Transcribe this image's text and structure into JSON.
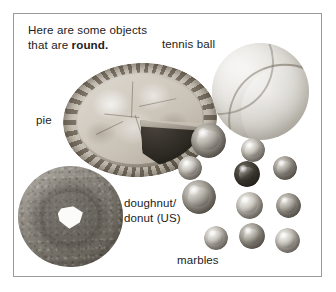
{
  "panel": {
    "border_color": "#9a9a9a",
    "background": "#ffffff"
  },
  "heading": {
    "line1": "Here are some objects",
    "line2_prefix": "that are ",
    "line2_bold": "round."
  },
  "labels": {
    "tennis_ball": "tennis ball",
    "pie": "pie",
    "doughnut_line1": "doughnut/",
    "doughnut_line2": "donut (US)",
    "marbles": "marbles"
  },
  "objects": [
    {
      "name": "pie",
      "shape": "ellipse",
      "note": "baked pie with crimped crust, one dark slice removed at lower right"
    },
    {
      "name": "tennis-ball",
      "shape": "circle",
      "note": "grayscale tennis ball with curved seam"
    },
    {
      "name": "doughnut",
      "shape": "torus",
      "note": "textured ring doughnut with irregular white hole"
    },
    {
      "name": "marbles",
      "shape": "circles",
      "note": "cluster of eleven glass marbles of varying size and tone"
    }
  ],
  "marbles": [
    {
      "id": 1,
      "x": 208,
      "y": 140,
      "size": 35,
      "tone": "mid"
    },
    {
      "id": 2,
      "x": 253,
      "y": 150,
      "size": 24,
      "tone": "light"
    },
    {
      "id": 3,
      "x": 190,
      "y": 168,
      "size": 24,
      "tone": "light"
    },
    {
      "id": 4,
      "x": 247,
      "y": 174,
      "size": 26,
      "tone": "dark"
    },
    {
      "id": 5,
      "x": 285,
      "y": 168,
      "size": 24,
      "tone": "mid"
    },
    {
      "id": 6,
      "x": 199,
      "y": 197,
      "size": 34,
      "tone": "mid"
    },
    {
      "id": 7,
      "x": 249,
      "y": 205,
      "size": 27,
      "tone": "light"
    },
    {
      "id": 8,
      "x": 288,
      "y": 205,
      "size": 25,
      "tone": "mid"
    },
    {
      "id": 9,
      "x": 216,
      "y": 238,
      "size": 24,
      "tone": "light"
    },
    {
      "id": 10,
      "x": 252,
      "y": 236,
      "size": 26,
      "tone": "mid"
    },
    {
      "id": 11,
      "x": 287,
      "y": 240,
      "size": 25,
      "tone": "light"
    }
  ]
}
